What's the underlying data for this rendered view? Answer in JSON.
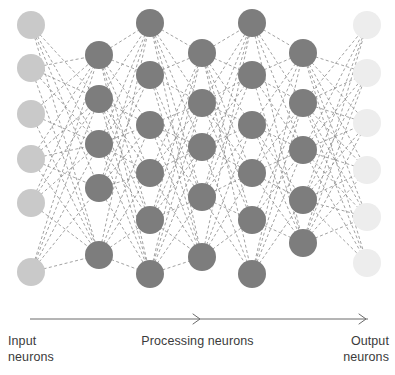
{
  "figure": {
    "background_color": "#ffffff"
  },
  "labels": {
    "input": "Input\nneurons",
    "processing": "Processing neurons",
    "output": "Output\nneurons"
  },
  "flow_arrow": {
    "name": "flow-arrow",
    "color": "#6b6b6b",
    "stroke_width": 1,
    "x_start": 30,
    "x_end": 368,
    "y": 319,
    "arrowheads_at_x": [
      200,
      366
    ]
  },
  "style": {
    "input_neuron_color": "#c9c9c9",
    "processing_neuron_color": "#7d7d7d",
    "output_neuron_color": "#ededed",
    "edge_color": "#8a8a8a",
    "edge_width": 0.8,
    "edge_dash": "3,2.4",
    "neuron_radius": 14
  },
  "chart_data": {
    "type": "diagram",
    "layers": [
      {
        "name": "input",
        "label": "Input neurons",
        "kind": "input",
        "color": "#c9c9c9",
        "count": 6,
        "x": 31,
        "node_y": [
          25,
          68,
          114,
          159,
          203,
          272
        ]
      },
      {
        "name": "hidden-1",
        "label": "Processing neurons",
        "kind": "processing",
        "color": "#7d7d7d",
        "count": 5,
        "x": 99,
        "node_y": [
          55,
          99,
          144,
          188,
          255
        ]
      },
      {
        "name": "hidden-2",
        "label": "Processing neurons",
        "kind": "processing",
        "color": "#7d7d7d",
        "count": 6,
        "x": 150,
        "node_y": [
          23,
          75,
          125,
          173,
          220,
          274
        ]
      },
      {
        "name": "hidden-3",
        "label": "Processing neurons",
        "kind": "processing",
        "color": "#7d7d7d",
        "count": 5,
        "x": 202,
        "node_y": [
          53,
          103,
          147,
          197,
          257
        ]
      },
      {
        "name": "hidden-4",
        "label": "Processing neurons",
        "kind": "processing",
        "color": "#7d7d7d",
        "count": 6,
        "x": 252,
        "node_y": [
          23,
          75,
          125,
          173,
          220,
          274
        ]
      },
      {
        "name": "hidden-5",
        "label": "Processing neurons",
        "kind": "processing",
        "color": "#7d7d7d",
        "count": 5,
        "x": 303,
        "node_y": [
          53,
          103,
          150,
          200,
          243
        ]
      },
      {
        "name": "output",
        "label": "Output neurons",
        "kind": "output",
        "color": "#ededed",
        "count": 6,
        "x": 367,
        "node_y": [
          25,
          73,
          123,
          170,
          217,
          263
        ]
      }
    ],
    "edges_description": "Each layer is densely connected to the next with thin dashed gray lines",
    "legend": [],
    "grid": false
  }
}
